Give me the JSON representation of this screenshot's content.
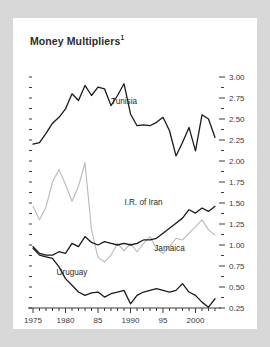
{
  "title": "Money Multipliers",
  "title_superscript": "1",
  "colors": {
    "background": "#d8d8d8",
    "panel": "#ffffff",
    "dark_line": "#1a1a1a",
    "light_line": "#b9b9b9",
    "axis": "#3a3a3a",
    "text": "#2b2b2b"
  },
  "chart_data": {
    "type": "line",
    "title": "Money Multipliers",
    "xlabel": "",
    "ylabel": "",
    "xlim": [
      1975,
      2003
    ],
    "ylim": [
      0.25,
      3.0
    ],
    "grid": false,
    "legend": "inline-annotations",
    "y_ticks": [
      "3.00",
      "2.75",
      "2.50",
      "2.25",
      "2.00",
      "1.75",
      "1.50",
      "1.25",
      "1.00",
      "0.75",
      "0.50",
      "0.25"
    ],
    "y_tick_values": [
      3.0,
      2.75,
      2.5,
      2.25,
      2.0,
      1.75,
      1.5,
      1.25,
      1.0,
      0.75,
      0.5,
      0.25
    ],
    "y_minor_tick_values": [
      2.875,
      2.625,
      2.375,
      2.125,
      1.875,
      1.625,
      1.375,
      1.125,
      0.875,
      0.625,
      0.375
    ],
    "x_ticks": [
      "1975",
      "1980",
      "85",
      "1990",
      "95",
      "2000"
    ],
    "x_tick_values": [
      1975,
      1980,
      1985,
      1990,
      1995,
      2000
    ],
    "x": [
      1975,
      1976,
      1977,
      1978,
      1979,
      1980,
      1981,
      1982,
      1983,
      1984,
      1985,
      1986,
      1987,
      1988,
      1989,
      1990,
      1991,
      1992,
      1993,
      1994,
      1995,
      1996,
      1997,
      1998,
      1999,
      2000,
      2001,
      2002,
      2003
    ],
    "series": [
      {
        "name": "Tunisia",
        "color": "#1a1a1a",
        "label_x": 1989,
        "label_y": 2.68,
        "values": [
          2.2,
          2.22,
          2.33,
          2.45,
          2.52,
          2.62,
          2.8,
          2.72,
          2.9,
          2.78,
          2.88,
          2.86,
          2.66,
          2.78,
          2.92,
          2.56,
          2.42,
          2.43,
          2.42,
          2.46,
          2.52,
          2.36,
          2.06,
          2.22,
          2.4,
          2.12,
          2.55,
          2.5,
          2.28
        ]
      },
      {
        "name": "Jamaica",
        "color": "#b9b9b9",
        "label_x": 1996,
        "label_y": 0.93,
        "values": [
          1.46,
          1.3,
          1.45,
          1.75,
          1.9,
          1.72,
          1.52,
          1.7,
          1.98,
          1.18,
          0.85,
          0.8,
          0.88,
          1.02,
          0.93,
          1.02,
          0.92,
          1.02,
          1.1,
          0.96,
          0.9,
          0.98,
          1.08,
          1.06,
          1.14,
          1.22,
          1.3,
          1.18,
          1.12
        ]
      },
      {
        "name": "I.R. of Iran",
        "color": "#1a1a1a",
        "label_x": 1992,
        "label_y": 1.48,
        "values": [
          0.98,
          0.9,
          0.88,
          0.88,
          0.92,
          0.9,
          1.02,
          0.98,
          1.1,
          1.03,
          1.0,
          1.04,
          1.02,
          1.0,
          1.02,
          1.0,
          1.02,
          1.06,
          1.06,
          1.08,
          1.14,
          1.2,
          1.26,
          1.32,
          1.42,
          1.38,
          1.44,
          1.4,
          1.46
        ]
      },
      {
        "name": "Uruguay",
        "color": "#1a1a1a",
        "label_x": 1981,
        "label_y": 0.64,
        "values": [
          0.96,
          0.88,
          0.86,
          0.84,
          0.74,
          0.6,
          0.52,
          0.44,
          0.4,
          0.43,
          0.44,
          0.38,
          0.42,
          0.44,
          0.46,
          0.3,
          0.4,
          0.44,
          0.46,
          0.48,
          0.46,
          0.44,
          0.46,
          0.54,
          0.44,
          0.4,
          0.32,
          0.26,
          0.36
        ]
      }
    ]
  }
}
